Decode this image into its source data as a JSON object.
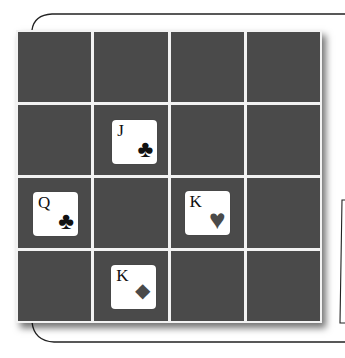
{
  "board": {
    "rows": 4,
    "cols": 4,
    "cell_color": "#4a4a4a",
    "line_color": "#f2f2f2"
  },
  "cards": [
    {
      "rank": "J",
      "suit": "clubs",
      "symbol": "♣",
      "row": 1,
      "col": 1,
      "suit_color": "#111111"
    },
    {
      "rank": "Q",
      "suit": "clubs",
      "symbol": "♣",
      "row": 2,
      "col": 0,
      "suit_color": "#111111"
    },
    {
      "rank": "K",
      "suit": "hearts",
      "symbol": "♥",
      "row": 2,
      "col": 2,
      "suit_color": "#4a4a4a"
    },
    {
      "rank": "K",
      "suit": "diamonds",
      "symbol": "◆",
      "row": 3,
      "col": 1,
      "suit_color": "#4a4a4a"
    }
  ]
}
